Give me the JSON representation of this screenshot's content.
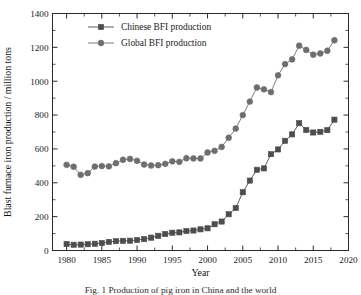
{
  "chart_data": {
    "type": "line",
    "title": "",
    "xlabel": "Year",
    "ylabel": "Blast furnace iron production / million tons",
    "xlim": [
      1978,
      2020
    ],
    "ylim": [
      0,
      1400
    ],
    "xticks": [
      "1980",
      "1985",
      "1990",
      "1995",
      "2000",
      "2005",
      "2010",
      "2015",
      "2020"
    ],
    "xtick_values": [
      1980,
      1985,
      1990,
      1995,
      2000,
      2005,
      2010,
      2015,
      2020
    ],
    "yticks": [
      "0",
      "200",
      "400",
      "600",
      "800",
      "1000",
      "1200",
      "1400"
    ],
    "ytick_values": [
      0,
      200,
      400,
      600,
      800,
      1000,
      1200,
      1400
    ],
    "grid": false,
    "legend_position": "top-left",
    "x": [
      1980,
      1981,
      1982,
      1983,
      1984,
      1985,
      1986,
      1987,
      1988,
      1989,
      1990,
      1991,
      1992,
      1993,
      1994,
      1995,
      1996,
      1997,
      1998,
      1999,
      2000,
      2001,
      2002,
      2003,
      2004,
      2005,
      2006,
      2007,
      2008,
      2009,
      2010,
      2011,
      2012,
      2013,
      2014,
      2015,
      2016,
      2017,
      2018
    ],
    "series": [
      {
        "name": "Chinese BFI production",
        "marker": "square",
        "color": "#4d4d4d",
        "values": [
          38,
          34,
          35,
          37,
          40,
          44,
          51,
          55,
          57,
          58,
          62,
          67,
          76,
          87,
          97,
          105,
          107,
          115,
          118,
          125,
          131,
          155,
          171,
          214,
          251,
          344,
          413,
          477,
          485,
          569,
          597,
          648,
          686,
          752,
          712,
          697,
          701,
          711,
          773
        ]
      },
      {
        "name": "Global BFI production",
        "marker": "circle",
        "color": "#6e6e6e",
        "values": [
          506,
          495,
          447,
          457,
          496,
          499,
          497,
          516,
          536,
          541,
          530,
          508,
          502,
          504,
          512,
          527,
          524,
          545,
          544,
          544,
          579,
          589,
          612,
          666,
          720,
          800,
          880,
          963,
          952,
          936,
          1035,
          1101,
          1129,
          1210,
          1185,
          1157,
          1164,
          1180,
          1242
        ]
      }
    ],
    "legend": [
      {
        "label": "Chinese BFI production",
        "marker": "square",
        "color": "#4d4d4d"
      },
      {
        "label": "Global BFI production",
        "marker": "circle",
        "color": "#6e6e6e"
      }
    ]
  },
  "caption": "Fig. 1  Production of pig iron in China and the world"
}
